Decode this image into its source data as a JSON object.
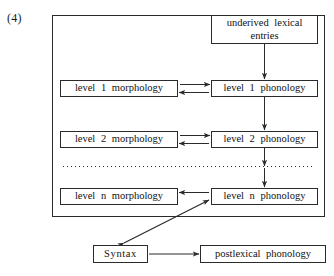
{
  "figure": {
    "example_number": "(4)",
    "outer_frame": {
      "name": "lexicon-frame"
    }
  },
  "nodes": {
    "underived": "underived lexical\nentries",
    "level1_morphology": "level 1  morphology",
    "level1_phonology": "level 1  phonology",
    "level2_morphology": "level 2  morphology",
    "level2_phonology": "level 2  phonology",
    "leveln_morphology": "level n  morphology",
    "leveln_phonology": "level n  phonology",
    "syntax": "Syntax",
    "postlexical": "postlexical  phonology"
  },
  "edges": [
    {
      "name": "underived-to-level1-phonology",
      "from": "underived",
      "to": "level1_phonology",
      "style": "vertical-arrow"
    },
    {
      "name": "level1-phonology-to-morphology",
      "from": "level1_phonology",
      "to": "level1_morphology",
      "style": "horizontal-arrow-left"
    },
    {
      "name": "level1-morphology-to-phonology",
      "from": "level1_morphology",
      "to": "level1_phonology",
      "style": "horizontal-arrow-right"
    },
    {
      "name": "level1-to-level2-phonology",
      "from": "level1_phonology",
      "to": "level2_phonology",
      "style": "vertical-arrow"
    },
    {
      "name": "level2-phonology-to-morphology",
      "from": "level2_phonology",
      "to": "level2_morphology",
      "style": "horizontal-arrow-left"
    },
    {
      "name": "level2-morphology-to-phonology",
      "from": "level2_morphology",
      "to": "level2_phonology",
      "style": "horizontal-arrow-right"
    },
    {
      "name": "level2-to-ellipsis",
      "from": "level2_phonology",
      "to": "ellipsis",
      "style": "vertical-arrow"
    },
    {
      "name": "ellipsis-to-leveln-phonology",
      "from": "ellipsis",
      "to": "leveln_phonology",
      "style": "vertical-arrow"
    },
    {
      "name": "leveln-phonology-to-morphology",
      "from": "leveln_phonology",
      "to": "leveln_morphology",
      "style": "horizontal-arrow-left"
    },
    {
      "name": "leveln-phonology-syntax-bidirectional",
      "from": "leveln_phonology",
      "to": "syntax",
      "style": "diagonal-double-arrow"
    },
    {
      "name": "syntax-to-postlexical",
      "from": "syntax",
      "to": "postlexical",
      "style": "horizontal-arrow-right"
    }
  ],
  "ellipsis": {
    "name": "level-continuation-dotted-line"
  },
  "colors": {
    "stroke": "#2b2b2b",
    "text": "#111111",
    "background": "#ffffff"
  }
}
